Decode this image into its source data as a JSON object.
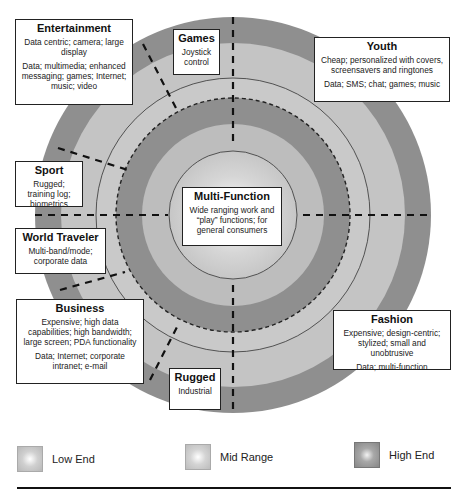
{
  "diagram": {
    "center": {
      "x": 233,
      "y": 215
    },
    "rings": [
      {
        "radius": 198,
        "tier": "High End",
        "color": "#8f8f8f"
      },
      {
        "radius": 172,
        "tier": "Mid Range",
        "color": "#c4c4c4"
      },
      {
        "radius": 137,
        "tier": "Mid Range",
        "color": "#c9c9c9"
      },
      {
        "radius": 117,
        "tier": "High End",
        "color": "#8f8f8f"
      },
      {
        "radius": 91,
        "tier": "Low End",
        "color": "#bdbdbd"
      },
      {
        "radius": 64,
        "tier": "Low End",
        "color": "#c4c4c4"
      }
    ],
    "colors": {
      "high_end": "#8f8f8f",
      "mid_range": "#c4c4c4",
      "low_end": "#bdbdbd",
      "line": "#222222",
      "box_border": "#222222"
    }
  },
  "segments": {
    "entertainment": {
      "title": "Entertainment",
      "desc1": "Data centric; camera; large display",
      "desc2": "Data; multimedia; enhanced messaging; games; Internet; music; video"
    },
    "games": {
      "title": "Games",
      "desc1": "Joystick control"
    },
    "youth": {
      "title": "Youth",
      "desc1": "Cheap; personalized with covers, screensavers and ringtones",
      "desc2": "Data; SMS; chat; games; music"
    },
    "sport": {
      "title": "Sport",
      "desc1": "Rugged; training log; biometrics"
    },
    "multi_function": {
      "title": "Multi-Function",
      "desc1": "Wide ranging work and “play” functions; for general consumers"
    },
    "world_traveler": {
      "title": "World Traveler",
      "desc1": "Multi-band/mode; corporate data"
    },
    "business": {
      "title": "Business",
      "desc1": "Expensive; high data capabilities; high bandwidth; large screen; PDA functionality",
      "desc2": "Data; Internet; corporate intranet; e-mail"
    },
    "rugged": {
      "title": "Rugged",
      "desc1": "Industrial"
    },
    "fashion": {
      "title": "Fashion",
      "desc1": "Expensive; design-centric; stylized; small and unobtrusive",
      "desc2": "Data; multi-function"
    }
  },
  "legend": {
    "items": [
      {
        "label": "Low End",
        "color": "#bdbdbd"
      },
      {
        "label": "Mid Range",
        "color": "#c4c4c4"
      },
      {
        "label": "High End",
        "color": "#8f8f8f"
      }
    ]
  }
}
